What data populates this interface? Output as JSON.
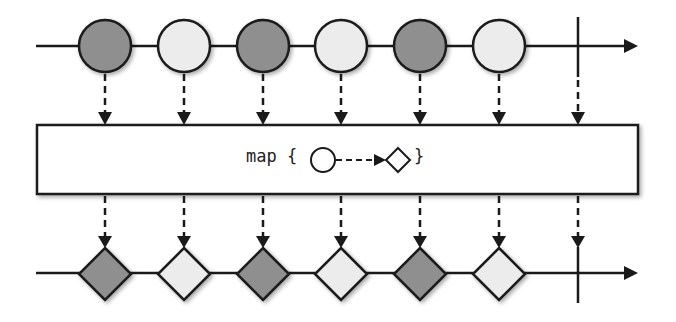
{
  "diagram": {
    "type": "marble-diagram",
    "operator": {
      "label": "map",
      "open_brace": "{",
      "close_brace": "}",
      "input_shape": "circle",
      "output_shape": "diamond"
    },
    "input_stream": {
      "items": [
        {
          "shape": "circle",
          "fill": "#8f8f8f"
        },
        {
          "shape": "circle",
          "fill": "#ececec"
        },
        {
          "shape": "circle",
          "fill": "#8f8f8f"
        },
        {
          "shape": "circle",
          "fill": "#ececec"
        },
        {
          "shape": "circle",
          "fill": "#8f8f8f"
        },
        {
          "shape": "circle",
          "fill": "#ececec"
        }
      ],
      "completed": true
    },
    "output_stream": {
      "items": [
        {
          "shape": "diamond",
          "fill": "#8f8f8f"
        },
        {
          "shape": "diamond",
          "fill": "#ececec"
        },
        {
          "shape": "diamond",
          "fill": "#8f8f8f"
        },
        {
          "shape": "diamond",
          "fill": "#ececec"
        },
        {
          "shape": "diamond",
          "fill": "#8f8f8f"
        },
        {
          "shape": "diamond",
          "fill": "#ececec"
        }
      ],
      "completed": true
    },
    "colors": {
      "dark_item": "#8f8f8f",
      "light_item": "#ececec",
      "stroke": "#1a1a1a",
      "background": "#ffffff"
    }
  }
}
